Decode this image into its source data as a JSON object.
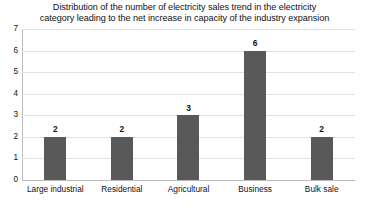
{
  "chart_data": {
    "type": "bar",
    "title": "Distribution of the number of electricity sales trend in the electricity category leading to the net increase in capacity of the industry expansion",
    "title_line1": "Distribution of the number of electricity sales trend in the electricity",
    "title_line2": "category leading to the net increase in capacity of the industry expansion",
    "categories": [
      "Large industrial",
      "Residential",
      "Agricultural",
      "Business",
      "Bulk sale"
    ],
    "values": [
      2,
      2,
      3,
      6,
      2
    ],
    "value_labels": [
      "2",
      "2",
      "3",
      "6",
      "2"
    ],
    "xlabel": "",
    "ylabel": "",
    "ylim": [
      0,
      7
    ],
    "y_ticks": [
      0,
      1,
      2,
      3,
      4,
      5,
      6,
      7
    ],
    "y_tick_labels": [
      "0",
      "1",
      "2",
      "3",
      "4",
      "5",
      "6",
      "7"
    ],
    "grid": true,
    "grid_axis": "y",
    "legend": false,
    "legend_position": "none",
    "series": [
      {
        "name": "Number of electricity sales trend",
        "values": [
          2,
          2,
          3,
          6,
          2
        ]
      }
    ],
    "colors": {
      "bar": "#595959",
      "gridline": "#e2e2e2",
      "axis": "#bdbdbd",
      "text": "#111111",
      "background": "#ffffff"
    }
  }
}
